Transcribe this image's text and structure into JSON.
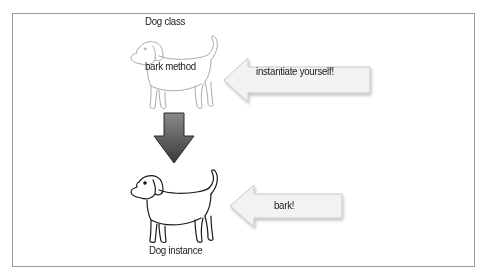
{
  "diagram": {
    "class_dog": {
      "title": "Dog class",
      "method_label": "bark method",
      "style": "light-outline"
    },
    "instance_dog": {
      "title": "Dog instance",
      "style": "dark-outline"
    },
    "arrows": [
      {
        "id": "instantiate",
        "direction": "left",
        "label": "instantiate yourself!"
      },
      {
        "id": "down",
        "direction": "down",
        "label": ""
      },
      {
        "id": "bark",
        "direction": "left",
        "label": "bark!"
      }
    ],
    "colors": {
      "frame_border": "#9a9a9a",
      "callout_fill": "#f2f2f2",
      "callout_border": "#c8c8c8",
      "down_arrow_top": "#8a8a8a",
      "down_arrow_bottom": "#3a3a3a",
      "class_dog_stroke": "#9a9a9a",
      "instance_dog_stroke": "#1a1a1a"
    }
  }
}
